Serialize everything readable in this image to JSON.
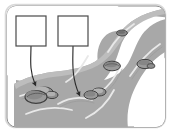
{
  "figure": {
    "title": "",
    "type": "labeled-illustration",
    "frame": {
      "shape": "rounded-rectangle",
      "outer_border_color": "#d9d9d9",
      "inner_border_color": "#8c8c8c",
      "background_color": "#ffffff",
      "corner_radius": 10
    },
    "colors": {
      "water_fill": "#a8a8a8",
      "water_edge": "#8f8f8f",
      "current_line": "#e8e8e8",
      "bank_shadow": "#bdbdbd",
      "rock_fill": "#9b9b9b",
      "rock_dark": "#6f6f6f",
      "rock_light": "#c2c2c2",
      "rock_outline": "#3f3f3f",
      "arrow_color": "#2b2b2b",
      "box_border": "#4a4a4a",
      "box_fill": "#ffffff"
    },
    "label_boxes": [
      {
        "id": "label-box-left",
        "text": "",
        "placeholder": "",
        "x": 16,
        "y": 16,
        "width": 30,
        "height": 30,
        "points_to": "large-rock-cluster"
      },
      {
        "id": "label-box-right",
        "text": "",
        "placeholder": "",
        "x": 58,
        "y": 16,
        "width": 30,
        "height": 30,
        "points_to": "flowing-water-current"
      }
    ],
    "arrows": [
      {
        "id": "arrow-left",
        "from_box": "label-box-left",
        "start": [
          31,
          46
        ],
        "end": [
          36,
          85
        ],
        "style": "curved-down",
        "head": "solid-triangle"
      },
      {
        "id": "arrow-right",
        "from_box": "label-box-right",
        "start": [
          73,
          46
        ],
        "end": [
          78,
          96
        ],
        "style": "curved-down",
        "head": "solid-triangle"
      }
    ],
    "rocks": [
      {
        "id": "rock-cluster-large",
        "cx": 38,
        "cy": 94,
        "rx": 16,
        "ry": 9,
        "size": "large"
      },
      {
        "id": "rock-midstream",
        "cx": 95,
        "cy": 93,
        "rx": 9,
        "ry": 5,
        "size": "medium"
      },
      {
        "id": "rock-upper-left-bend",
        "cx": 112,
        "cy": 65,
        "rx": 9,
        "ry": 5,
        "size": "medium"
      },
      {
        "id": "rock-right-bank",
        "cx": 143,
        "cy": 64,
        "rx": 9,
        "ry": 5,
        "size": "medium"
      },
      {
        "id": "rock-far-upstream",
        "cx": 121,
        "cy": 33,
        "rx": 6,
        "ry": 3,
        "size": "small"
      }
    ],
    "current_lines": 7,
    "caption": ""
  }
}
